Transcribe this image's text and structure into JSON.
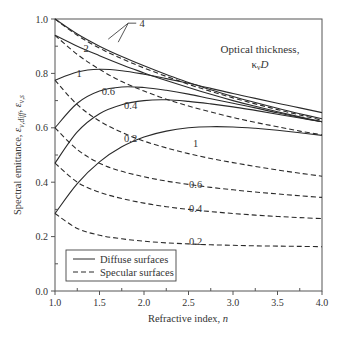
{
  "chart_data": {
    "type": "line",
    "title": "",
    "xlabel": "Refractive index, n",
    "ylabel": "Spectral emittance, ε_ν,diff, ε_ν,s",
    "xlim": [
      1.0,
      4.0
    ],
    "ylim": [
      0.0,
      1.0
    ],
    "xticks": [
      "1.0",
      "1.5",
      "2.0",
      "2.5",
      "3.0",
      "3.5",
      "4.0"
    ],
    "yticks": [
      "0.0",
      "0.2",
      "0.4",
      "0.6",
      "0.8",
      "1.0"
    ],
    "grid": false,
    "legend_position": "lower left",
    "legend": [
      {
        "label": "Diffuse surfaces",
        "style": "solid"
      },
      {
        "label": "Specular surfaces",
        "style": "dashed"
      }
    ],
    "annotation": {
      "line1": "Optical thickness,",
      "line2": "κ",
      "sub": "ν",
      "line2b": "D"
    },
    "x": [
      1.0,
      1.25,
      1.5,
      1.75,
      2.0,
      2.25,
      2.5,
      2.75,
      3.0,
      3.25,
      3.5,
      3.75,
      4.0
    ],
    "series": [
      {
        "name": "Diffuse, κνD = 4",
        "style": "solid",
        "label": "4",
        "values": [
          1.0,
          0.945,
          0.9,
          0.862,
          0.828,
          0.796,
          0.767,
          0.74,
          0.715,
          0.693,
          0.672,
          0.652,
          0.633
        ]
      },
      {
        "name": "Specular, κνD = 4",
        "style": "dashed",
        "label": "",
        "values": [
          1.0,
          0.94,
          0.893,
          0.854,
          0.82,
          0.789,
          0.76,
          0.734,
          0.71,
          0.688,
          0.667,
          0.647,
          0.628
        ]
      },
      {
        "name": "Diffuse, κνD = 2",
        "style": "solid",
        "label": "2",
        "values": [
          0.94,
          0.9,
          0.865,
          0.832,
          0.802,
          0.774,
          0.748,
          0.723,
          0.7,
          0.679,
          0.659,
          0.64,
          0.622
        ]
      },
      {
        "name": "Specular, κνD = 2",
        "style": "dashed",
        "label": "",
        "values": [
          0.94,
          0.87,
          0.815,
          0.77,
          0.735,
          0.705,
          0.68,
          0.658,
          0.638,
          0.62,
          0.604,
          0.588,
          0.574
        ]
      },
      {
        "name": "Diffuse, κνD = 1",
        "style": "solid",
        "label": "1",
        "values": [
          0.775,
          0.805,
          0.815,
          0.81,
          0.797,
          0.781,
          0.764,
          0.745,
          0.726,
          0.708,
          0.69,
          0.673,
          0.656
        ]
      },
      {
        "name": "Specular, κνD = 1",
        "style": "dashed",
        "label": "1",
        "values": [
          0.775,
          0.685,
          0.625,
          0.583,
          0.551,
          0.526,
          0.505,
          0.487,
          0.472,
          0.458,
          0.445,
          0.433,
          0.422
        ]
      },
      {
        "name": "Diffuse, κνD = 0.6",
        "style": "solid",
        "label": "0.6",
        "values": [
          0.6,
          0.69,
          0.735,
          0.75,
          0.748,
          0.738,
          0.724,
          0.707,
          0.69,
          0.673,
          0.655,
          0.638,
          0.622
        ]
      },
      {
        "name": "Specular, κνD = 0.6",
        "style": "dashed",
        "label": "0.6",
        "values": [
          0.6,
          0.52,
          0.47,
          0.44,
          0.42,
          0.404,
          0.392,
          0.381,
          0.372,
          0.364,
          0.357,
          0.35,
          0.344
        ]
      },
      {
        "name": "Diffuse, κνD = 0.4",
        "style": "solid",
        "label": "0.4",
        "values": [
          0.47,
          0.585,
          0.652,
          0.685,
          0.7,
          0.703,
          0.697,
          0.688,
          0.677,
          0.664,
          0.65,
          0.636,
          0.622
        ]
      },
      {
        "name": "Specular, κνD = 0.4",
        "style": "dashed",
        "label": "0.4",
        "values": [
          0.47,
          0.4,
          0.363,
          0.34,
          0.323,
          0.31,
          0.3,
          0.292,
          0.285,
          0.279,
          0.274,
          0.27,
          0.266
        ]
      },
      {
        "name": "Diffuse, κνD = 0.2",
        "style": "solid",
        "label": "0.2",
        "values": [
          0.285,
          0.395,
          0.475,
          0.53,
          0.566,
          0.588,
          0.6,
          0.604,
          0.603,
          0.598,
          0.591,
          0.582,
          0.572
        ]
      },
      {
        "name": "Specular, κνD = 0.2",
        "style": "dashed",
        "label": "0.2",
        "values": [
          0.285,
          0.23,
          0.205,
          0.192,
          0.183,
          0.177,
          0.173,
          0.17,
          0.168,
          0.166,
          0.165,
          0.164,
          0.163
        ]
      }
    ],
    "curve_labels": [
      {
        "text": "4",
        "n": 1.98,
        "y": 0.97
      },
      {
        "text": "2",
        "n": 1.35,
        "y": 0.88
      },
      {
        "text": "1",
        "n": 1.27,
        "y": 0.785
      },
      {
        "text": "0.6",
        "n": 1.6,
        "y": 0.72
      },
      {
        "text": "0.4",
        "n": 1.85,
        "y": 0.668
      },
      {
        "text": "0.2",
        "n": 1.85,
        "y": 0.548
      },
      {
        "text": "1",
        "n": 2.58,
        "y": 0.53
      },
      {
        "text": "0.6",
        "n": 2.58,
        "y": 0.38
      },
      {
        "text": "0.4",
        "n": 2.58,
        "y": 0.29
      },
      {
        "text": "0.2",
        "n": 2.58,
        "y": 0.168
      }
    ]
  },
  "colors": {
    "line": "#2a2a2a",
    "axis": "#555555",
    "text": "#333333",
    "background": "#ffffff"
  }
}
